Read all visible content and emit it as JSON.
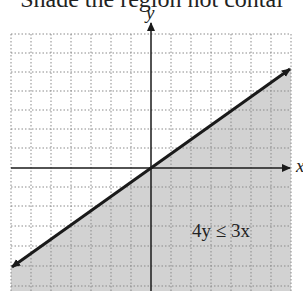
{
  "header": {
    "text": "Shade the region not contai"
  },
  "axes": {
    "x_label": "x",
    "y_label": "y"
  },
  "graph": {
    "inequality_label": "4y ≤ 3x",
    "boundary_line": "4y = 3x",
    "shaded_region": "below line",
    "grid_spacing_px": 20,
    "colors": {
      "shade": "#cfcfcf",
      "grid": "#8a8a8a",
      "line": "#1a1a1a"
    }
  }
}
